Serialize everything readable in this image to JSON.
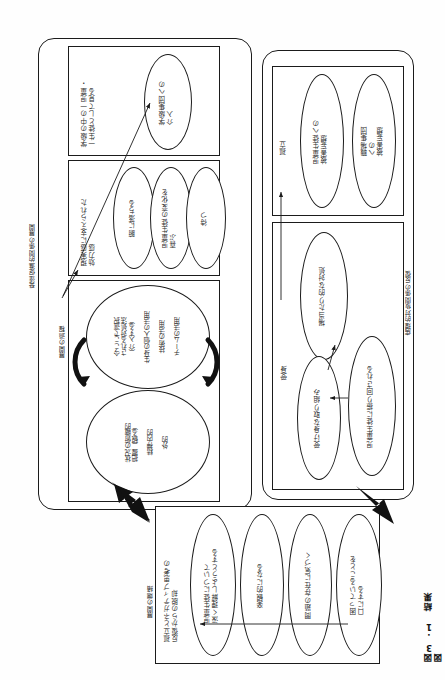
{
  "figure": {
    "caption": "図3.1 結果図",
    "side_labels": {
      "left_top_group": "発達促進的関係の展開",
      "left_process": "展開の過程",
      "right_group": "病理的対象関係の反復",
      "bottom_group": "展開の端緒"
    }
  },
  "panel_development": {
    "name": "発達促進的関係の展開",
    "section_class_view": {
      "label": "学級の中の一児童・\n一生徒として見る",
      "ellipses": [
        {
          "text": "学級集団への\n介入"
        }
      ]
    },
    "section_efficacy": {
      "label": "現実感に支えられた\n効力感",
      "ellipses": [
        {
          "text": "腑に落ちる"
        },
        {
          "text": "児童生徒の変化を\n喜ぶ"
        },
        {
          "text": "待つ"
        }
      ]
    },
    "section_process": {
      "label": "展開の過程",
      "ellipse_upper": "今ここで選択\nされる対処法\n（介入する）\n\n生身の個人の活用\n\n技術の活用\n\nチームの活用",
      "ellipse_lower": "状況の俯瞰的\n把握（観る）\n\n精神内的\n\n外的"
    }
  },
  "panel_pathology": {
    "name": "病理的対象関係の反復",
    "section_isolation": {
      "label": "孤立",
      "ellipses": [
        {
          "text": "児童生徒への\n被害妄想"
        },
        {
          "text": "職場集団\nへの\n被害妄想"
        }
      ]
    },
    "section_passive": {
      "label": "受身",
      "ellipses": [
        {
          "text": "場当たり的な対処"
        },
        {
          "text": "受け身な取り組み"
        },
        {
          "text": "児童生徒に振り回される"
        }
      ]
    }
  },
  "panel_onset": {
    "name": "展開の端緒",
    "label": "孤立とネガティブ思考の\n反復からの脱却",
    "ellipses": [
      {
        "text": "児童生徒について\n深く理解しようとする"
      },
      {
        "text": "楽観的になる"
      },
      {
        "text": "問題の存在に気づく"
      },
      {
        "text": "困っていることを\n口にする"
      }
    ]
  }
}
